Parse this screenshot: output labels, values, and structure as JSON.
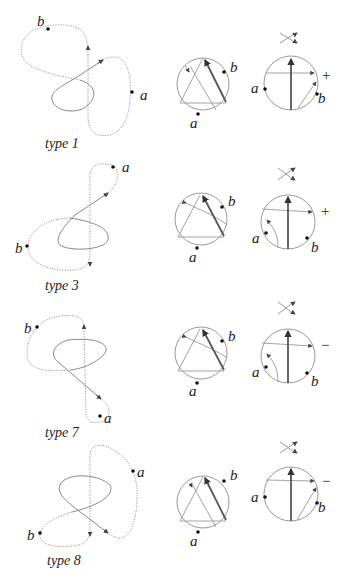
{
  "figure": {
    "rows": [
      {
        "caption": "type 1",
        "knot": {
          "labels": {
            "a": "a",
            "b": "b"
          }
        },
        "gauss_diagram": {
          "labels": {
            "a": "a",
            "b": "b"
          }
        },
        "crossing_diagram": {
          "labels": {
            "a": "a",
            "b": "b"
          },
          "sign": "+"
        }
      },
      {
        "caption": "type 3",
        "knot": {
          "labels": {
            "a": "a",
            "b": "b"
          }
        },
        "gauss_diagram": {
          "labels": {
            "a": "a",
            "b": "b"
          }
        },
        "crossing_diagram": {
          "labels": {
            "a": "a",
            "b": "b"
          },
          "sign": "+"
        }
      },
      {
        "caption": "type 7",
        "knot": {
          "labels": {
            "a": "a",
            "b": "b"
          }
        },
        "gauss_diagram": {
          "labels": {
            "a": "a",
            "b": "b"
          }
        },
        "crossing_diagram": {
          "labels": {
            "a": "a",
            "b": "b"
          },
          "sign": "−"
        }
      },
      {
        "caption": "type 8",
        "knot": {
          "labels": {
            "a": "a",
            "b": "b"
          }
        },
        "gauss_diagram": {
          "labels": {
            "a": "a",
            "b": "b"
          }
        },
        "crossing_diagram": {
          "labels": {
            "a": "a",
            "b": "b"
          },
          "sign": "−"
        }
      }
    ]
  }
}
